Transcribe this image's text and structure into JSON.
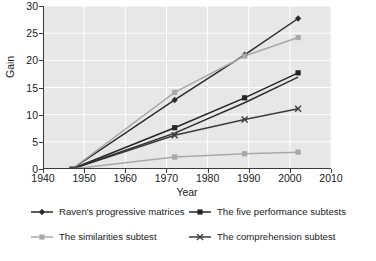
{
  "chart_data": {
    "type": "line",
    "title": "",
    "xlabel": "Year",
    "ylabel": "Gain",
    "xlim": [
      1940,
      2010
    ],
    "ylim": [
      0,
      30
    ],
    "xticks": [
      1940,
      1950,
      1960,
      1970,
      1980,
      1990,
      2000,
      2010
    ],
    "yticks": [
      0,
      5,
      10,
      15,
      20,
      25,
      30
    ],
    "grid": true,
    "legend_position": "bottom",
    "x": [
      1947,
      1972,
      1989,
      2002
    ],
    "series": [
      {
        "name": "Raven's progressive matrices",
        "values": [
          0,
          12.7,
          21.0,
          27.7
        ],
        "color": "#2b2b2b",
        "marker": "diamond"
      },
      {
        "name": "The five performance subtests",
        "values": [
          0,
          7.6,
          13.1,
          17.7
        ],
        "color": "#242424",
        "marker": "square"
      },
      {
        "name": "The similarities subtest",
        "values": [
          0,
          14.1,
          20.8,
          24.2
        ],
        "color": "#a8a8a8",
        "marker": "square"
      },
      {
        "name": "The comprehension subtest",
        "values": [
          0,
          6.2,
          9.1,
          11.1
        ],
        "color": "#3c3c3c",
        "marker": "x"
      },
      {
        "name": "The vocabulary subtest",
        "values": [
          0,
          6.6,
          12.2,
          16.9
        ],
        "color": "#2e2e2e",
        "marker": "none"
      },
      {
        "name": "The information subtest",
        "values": [
          0,
          2.2,
          2.8,
          3.1
        ],
        "color": "#a8a8a8",
        "marker": "square"
      }
    ]
  },
  "axes": {
    "y_title": "Gain",
    "x_title": "Year",
    "y_tick_labels": [
      "0",
      "5",
      "10",
      "15",
      "20",
      "25",
      "30"
    ],
    "x_tick_labels": [
      "1940",
      "1950",
      "1960",
      "1970",
      "1980",
      "1990",
      "2000",
      "2010"
    ]
  },
  "legend": {
    "items": [
      {
        "label": "Raven's progressive matrices",
        "marker": "diamond",
        "color": "#2b2b2b"
      },
      {
        "label": "The five performance subtests",
        "marker": "square",
        "color": "#242424"
      },
      {
        "label": "The similarities subtest",
        "marker": "square",
        "color": "#a8a8a8"
      },
      {
        "label": "The comprehension subtest",
        "marker": "x",
        "color": "#3c3c3c"
      }
    ]
  },
  "colors": {
    "plot_background": "#e7e7e7",
    "gridline": "#ffffff",
    "axis": "#3a3a3a",
    "page_background": "#ffffff"
  }
}
